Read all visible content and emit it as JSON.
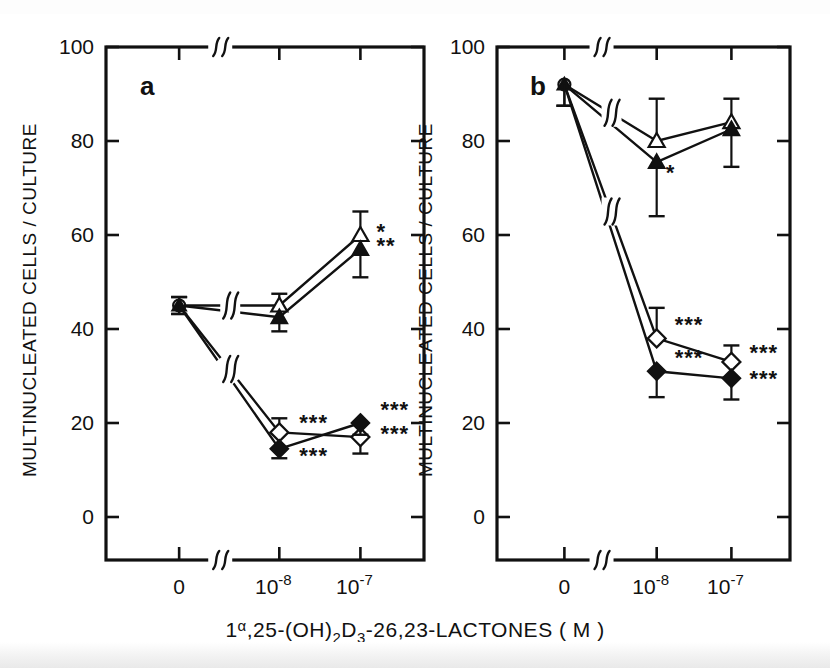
{
  "figure": {
    "y_axis_label": "MULTINUCLEATED  CELLS / CULTURE",
    "x_axis_label_main": "1",
    "x_axis_label_alpha": "α",
    "x_axis_label_part2": ",25-(OH)",
    "x_axis_label_sub2": "2",
    "x_axis_label_part3": "D",
    "x_axis_label_sub3": "3",
    "x_axis_label_part4": "-26,23-LACTONES",
    "x_axis_label_units": "( M )",
    "y_ticks": [
      "0",
      "20",
      "40",
      "60",
      "80",
      "100"
    ],
    "x_ticks": [
      "0",
      "10",
      "10"
    ],
    "x_tick_exponents": [
      "-8",
      "-7"
    ],
    "axis_break_symbol": "ʃʃ",
    "panel_a_label": "a",
    "panel_b_label": "b"
  },
  "chart_data": [
    {
      "type": "line",
      "panel": "a",
      "title": "a",
      "xlabel": "1α,25-(OH)2D3-26,23-LACTONES ( M )",
      "ylabel": "MULTINUCLEATED CELLS / CULTURE",
      "ylim": [
        0,
        100
      ],
      "categories": [
        "0",
        "10^-8",
        "10^-7"
      ],
      "grid": false,
      "legend": "none",
      "series": [
        {
          "name": "open-triangle",
          "marker": "open-triangle",
          "values": [
            45.0,
            45.0,
            60.0
          ],
          "errors": [
            1.8,
            2.5,
            5.0
          ],
          "significance": [
            "",
            "",
            "*"
          ]
        },
        {
          "name": "filled-triangle",
          "marker": "filled-triangle",
          "values": [
            45.0,
            42.5,
            57.0
          ],
          "errors": [
            1.8,
            3.0,
            6.0
          ],
          "significance": [
            "",
            "",
            "**"
          ]
        },
        {
          "name": "open-diamond",
          "marker": "open-diamond",
          "values": [
            45.0,
            18.0,
            17.0
          ],
          "errors": [
            1.8,
            3.0,
            3.5
          ],
          "significance": [
            "",
            "***",
            "***"
          ]
        },
        {
          "name": "filled-diamond",
          "marker": "filled-diamond",
          "values": [
            45.0,
            14.5,
            20.0
          ],
          "errors": [
            1.8,
            2.0,
            2.5
          ],
          "significance": [
            "",
            "***",
            "***"
          ]
        }
      ]
    },
    {
      "type": "line",
      "panel": "b",
      "title": "b",
      "xlabel": "1α,25-(OH)2D3-26,23-LACTONES ( M )",
      "ylabel": "MULTINUCLEATED CELLS / CULTURE",
      "ylim": [
        0,
        100
      ],
      "categories": [
        "0",
        "10^-8",
        "10^-7"
      ],
      "grid": false,
      "legend": "none",
      "series": [
        {
          "name": "open-triangle",
          "marker": "open-triangle",
          "values": [
            92.0,
            80.0,
            84.0
          ],
          "errors": [
            0.0,
            9.0,
            5.0
          ],
          "significance": [
            "",
            "",
            ""
          ]
        },
        {
          "name": "filled-triangle",
          "marker": "filled-triangle",
          "values": [
            92.0,
            75.5,
            82.5
          ],
          "errors": [
            4.5,
            11.5,
            8.0
          ],
          "significance": [
            "",
            "*",
            ""
          ]
        },
        {
          "name": "open-diamond",
          "marker": "open-diamond",
          "values": [
            92.0,
            38.0,
            33.0
          ],
          "errors": [
            0.0,
            6.5,
            3.5
          ],
          "significance": [
            "",
            "***",
            "***"
          ]
        },
        {
          "name": "filled-diamond",
          "marker": "filled-diamond",
          "values": [
            92.0,
            31.0,
            29.5
          ],
          "errors": [
            4.5,
            5.5,
            4.5
          ],
          "significance": [
            "",
            "***",
            "***"
          ]
        }
      ]
    }
  ]
}
